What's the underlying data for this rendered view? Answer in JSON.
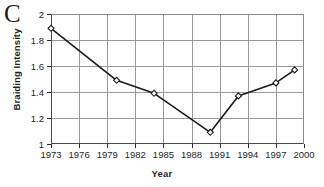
{
  "panel": {
    "letter": "C"
  },
  "chart_data": {
    "type": "line",
    "title": "",
    "panel_label": "C",
    "xlabel": "Year",
    "ylabel": "Braiding Intensity",
    "xlim": [
      1973,
      2000
    ],
    "ylim": [
      1,
      2
    ],
    "grid": true,
    "legend": null,
    "x_ticks": [
      1973,
      1976,
      1979,
      1982,
      1985,
      1988,
      1991,
      1994,
      1997,
      2000
    ],
    "x_tick_labels": [
      "1973",
      "1976",
      "1979",
      "1982",
      "1985",
      "1988",
      "1991",
      "1994",
      "1997",
      "2000"
    ],
    "y_ticks": [
      1,
      1.2,
      1.4,
      1.6,
      1.8,
      2
    ],
    "y_tick_labels": [
      "1",
      "1.2",
      "1.4",
      "1.6",
      "1.8",
      "2"
    ],
    "marker": "open-diamond",
    "line_color": "#1a1a1a",
    "marker_color": "#1a1a1a",
    "series": [
      {
        "name": "Braiding Intensity",
        "x": [
          1973,
          1980,
          1984,
          1990,
          1993,
          1997,
          1999
        ],
        "values": [
          1.89,
          1.49,
          1.39,
          1.09,
          1.37,
          1.47,
          1.57
        ]
      }
    ],
    "points": [
      {
        "year": 1973,
        "value": 1.89
      },
      {
        "year": 1980,
        "value": 1.49
      },
      {
        "year": 1984,
        "value": 1.39
      },
      {
        "year": 1990,
        "value": 1.09
      },
      {
        "year": 1993,
        "value": 1.37
      },
      {
        "year": 1997,
        "value": 1.47
      },
      {
        "year": 1999,
        "value": 1.57
      }
    ]
  }
}
